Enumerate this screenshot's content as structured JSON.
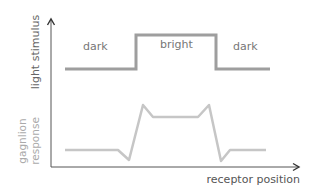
{
  "diagram": {
    "axes": {
      "y_label": "light stimulus",
      "y_label_secondary": [
        "gagnlion",
        "response"
      ],
      "x_label": "receptor position",
      "color": "#444444"
    },
    "stimulus": {
      "regions": [
        {
          "label": "dark",
          "level": "low"
        },
        {
          "label": "bright",
          "level": "high"
        },
        {
          "label": "dark",
          "level": "low"
        }
      ],
      "points": "65,69 136,69 136,35 216,35 216,69 270,69",
      "color": "#9e9e9e"
    },
    "response": {
      "points": "65,150 118,150 129,160 143,105 153,117 198,117 209,105 221,161 230,150 266,150",
      "color": "#c6c6c6"
    },
    "label_colors": {
      "region": "#777777",
      "y_axis": "#666666",
      "response_axis": "#aaaaaa",
      "x_axis": "#555555"
    }
  }
}
